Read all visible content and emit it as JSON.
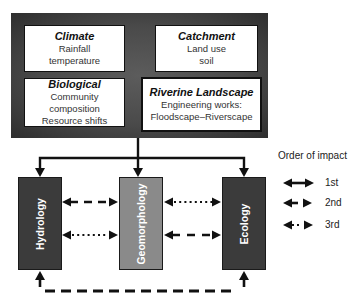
{
  "drivers": {
    "climate": {
      "title": "Climate",
      "lines": [
        "Rainfall",
        "temperature"
      ]
    },
    "catchment": {
      "title": "Catchment",
      "lines": [
        "Land use",
        "soil"
      ]
    },
    "biological": {
      "title": "Biological",
      "lines": [
        "Community composition",
        "Resource shifts"
      ]
    },
    "riverine": {
      "title": "Riverine Landscape",
      "lines": [
        "Engineering works:",
        "Floodscape–Riverscape"
      ]
    }
  },
  "processes": {
    "hydrology": {
      "label": "Hydrology",
      "fill": "#3b3b3b"
    },
    "geomorphology": {
      "label": "Geomorphology",
      "fill": "#8a8a8a"
    },
    "ecology": {
      "label": "Ecology",
      "fill": "#3b3b3b"
    }
  },
  "interactions": [
    {
      "from": "Hydrology",
      "to": "Geomorphology",
      "order": "2nd",
      "style": "dashed"
    },
    {
      "from": "Hydrology",
      "to": "Geomorphology",
      "order": "3rd",
      "style": "dotted"
    },
    {
      "from": "Geomorphology",
      "to": "Ecology",
      "order": "3rd",
      "style": "dotted"
    },
    {
      "from": "Geomorphology",
      "to": "Ecology",
      "order": "2nd",
      "style": "dashed"
    },
    {
      "from": "Ecology",
      "to": "Hydrology",
      "order": "2nd",
      "style": "dashed",
      "route": "bottom loop"
    },
    {
      "from": "Drivers",
      "to": "Hydrology, Geomorphology, Ecology",
      "order": "1st",
      "style": "solid"
    }
  ],
  "legend": {
    "title": "Order of impact",
    "items": [
      {
        "label": "1st",
        "style": "solid"
      },
      {
        "label": "2nd",
        "style": "dashed"
      },
      {
        "label": "3rd",
        "style": "dotted"
      }
    ]
  }
}
